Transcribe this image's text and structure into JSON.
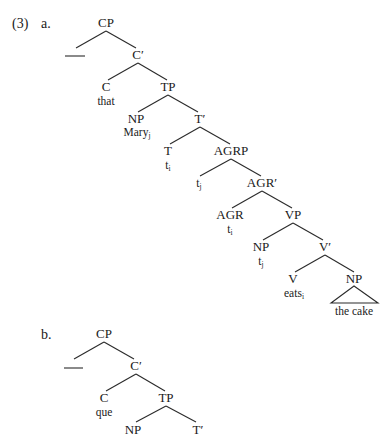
{
  "example_number": "(3)",
  "tree_a": {
    "letter": "a.",
    "nodes": {
      "cp": "CP",
      "spec_cp": "___",
      "c_bar": "C′",
      "c": "C",
      "c_word": "that",
      "tp": "TP",
      "np_subject": "NP",
      "np_subject_word": "Mary",
      "np_subject_index": "j",
      "t_bar": "T′",
      "t": "T",
      "t_trace": "t",
      "t_trace_index": "i",
      "agrp": "AGRP",
      "spec_agrp_trace": "t",
      "spec_agrp_trace_index": "j",
      "agr_bar": "AGR′",
      "agr": "AGR",
      "agr_trace": "t",
      "agr_trace_index": "i",
      "vp": "VP",
      "np_vp_spec": "NP",
      "np_vp_spec_trace": "t",
      "np_vp_spec_trace_index": "j",
      "v_bar": "V′",
      "v": "V",
      "v_word": "eats",
      "v_word_index": "i",
      "np_object": "NP",
      "np_object_word": "the cake"
    }
  },
  "tree_b": {
    "letter": "b.",
    "nodes": {
      "cp": "CP",
      "spec_cp": "___",
      "c_bar": "C′",
      "c": "C",
      "c_word": "que",
      "tp": "TP",
      "np_subject": "NP",
      "t_bar": "T′"
    }
  }
}
